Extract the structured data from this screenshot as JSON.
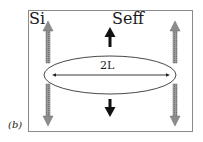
{
  "figure": {
    "panel_label": "(b)",
    "labels": {
      "left": "Si",
      "right": "Seff",
      "length": "2L"
    },
    "colors": {
      "frame": "#8a8a8a",
      "gray_arrow": "#8c8c8c",
      "black_arrow": "#111111",
      "ellipse": "#333333"
    },
    "elements": [
      {
        "type": "frame",
        "desc": "rectangular box border"
      },
      {
        "type": "ellipse",
        "desc": "horizontal ellipse with 2L length arrow"
      },
      {
        "type": "arrow",
        "color": "gray",
        "direction": "up",
        "position": "left"
      },
      {
        "type": "arrow",
        "color": "gray",
        "direction": "down",
        "position": "left"
      },
      {
        "type": "arrow",
        "color": "gray",
        "direction": "up",
        "position": "right"
      },
      {
        "type": "arrow",
        "color": "gray",
        "direction": "down",
        "position": "right"
      },
      {
        "type": "arrow",
        "color": "black",
        "direction": "up",
        "position": "center"
      },
      {
        "type": "arrow",
        "color": "black",
        "direction": "down",
        "position": "center"
      }
    ]
  }
}
